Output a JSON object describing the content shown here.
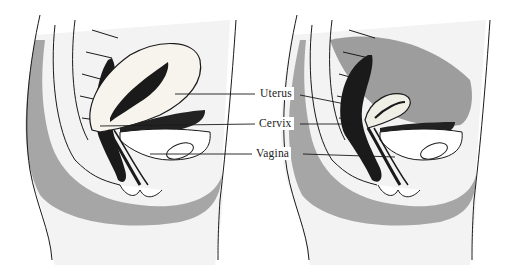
{
  "figure": {
    "type": "anatomical-illustration",
    "panels": [
      {
        "id": "left",
        "description": "Sagittal pelvic view with enlarged uterus (tilted forward)"
      },
      {
        "id": "right",
        "description": "Sagittal pelvic view with smaller uterus"
      }
    ],
    "labels": [
      {
        "id": "uterus",
        "text": "Uterus",
        "x": 258,
        "y": 94
      },
      {
        "id": "cervix",
        "text": "Cervix",
        "x": 257,
        "y": 119
      },
      {
        "id": "vagina",
        "text": "Vagina",
        "x": 254,
        "y": 150
      }
    ],
    "colors": {
      "ink": "#1a1a1a",
      "shade": "#555555",
      "paper": "#ffffff"
    }
  }
}
